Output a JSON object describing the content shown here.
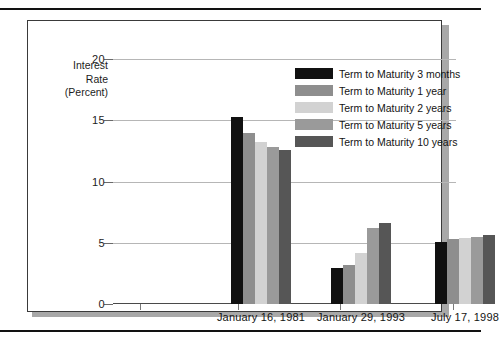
{
  "figure": {
    "background_color": "#ffffff",
    "box_border_color": "#3a3a3a",
    "shadow_color": "#a8a8a8",
    "rule_color": "#121212"
  },
  "axis_title": {
    "line1": "Interest",
    "line2": "Rate",
    "line3": "(Percent)"
  },
  "chart_data": {
    "type": "bar",
    "title": "",
    "subtitle": "",
    "xlabel": "",
    "ylabel": "Interest Rate (Percent)",
    "ylim": [
      0,
      20
    ],
    "yticks": [
      0,
      5,
      10,
      15,
      20
    ],
    "ytick_labels": [
      "0",
      "5",
      "10",
      "15",
      "20"
    ],
    "grid": true,
    "grid_axis": "y",
    "legend_position": "top-right",
    "categories": [
      "January 16, 1981",
      "January 29, 1993",
      "July 17, 1998"
    ],
    "series": [
      {
        "name": "Term to Maturity 3 months",
        "color": "#111111",
        "values": [
          15.3,
          2.9,
          5.1
        ]
      },
      {
        "name": "Term to Maturity 1 year",
        "color": "#8e8e8e",
        "values": [
          14.0,
          3.2,
          5.3
        ]
      },
      {
        "name": "Term to Maturity 2 years",
        "color": "#d2d2d2",
        "values": [
          13.2,
          4.2,
          5.4
        ]
      },
      {
        "name": "Term to Maturity 5 years",
        "color": "#9a9a9a",
        "values": [
          12.8,
          6.2,
          5.5
        ]
      },
      {
        "name": "Term to Maturity 10 years",
        "color": "#565656",
        "values": [
          12.6,
          6.6,
          5.6
        ]
      }
    ]
  }
}
